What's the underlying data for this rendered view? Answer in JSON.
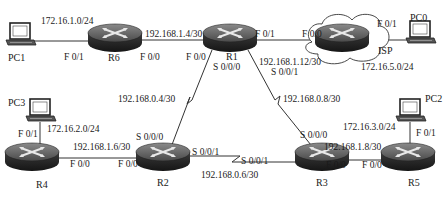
{
  "diagram": {
    "type": "network-topology",
    "devices": {
      "pc1": {
        "label": "PC1"
      },
      "pc0": {
        "label": "PC0"
      },
      "pc2": {
        "label": "PC2"
      },
      "pc3": {
        "label": "PC3"
      },
      "r1": {
        "label": "R1"
      },
      "r2": {
        "label": "R2"
      },
      "r3": {
        "label": "R3"
      },
      "r4": {
        "label": "R4"
      },
      "r5": {
        "label": "R5"
      },
      "r6": {
        "label": "R6"
      },
      "isp": {
        "label": "ISP"
      }
    },
    "networks": {
      "pc1_lan": "172.16.1.0/24",
      "r6_r1": "192.168.1.4/30",
      "r1_isp": "192.168.1.12/30",
      "pc0_lan": "172.16.5.0/24",
      "r1_r2": "192.168.0.4/30",
      "r1_r3": "192.168.0.8/30",
      "pc3_lan": "172.16.2.0/24",
      "r4_r2": "192.168.1.6/30",
      "r2_r3": "192.168.0.6/30",
      "pc2_lan": "172.16.3.0/24",
      "r3_r5": "192.168.1.8/30"
    },
    "interfaces": {
      "r6_f01": "F 0/1",
      "r6_f00": "F 0/0",
      "r1_f00": "F 0/0",
      "r1_f01": "F 0/1",
      "r1_s000": "S 0/0/0",
      "r1_s001": "S 0/0/1",
      "isp_f00": "F 0/0",
      "isp_f01": "F 0/1",
      "r4_f01": "F 0/1",
      "r4_f00": "F 0/0",
      "r2_f00": "F 0/0",
      "r2_s000": "S 0/0/0",
      "r2_s001": "S 0/0/1",
      "r3_s001": "S 0/0/1",
      "r3_s000": "S 0/0/0",
      "r3_f00": "F 0/0",
      "r5_f00": "F 0/0",
      "r5_f01": "F 0/1"
    }
  }
}
